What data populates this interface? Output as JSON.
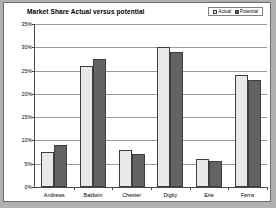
{
  "chart_data": {
    "type": "bar",
    "title": "Market Share Actual versus potential",
    "xlabel": "",
    "ylabel": "",
    "categories": [
      "Andrews",
      "Baldwin",
      "Chester",
      "Digby",
      "Erie",
      "Ferris"
    ],
    "series": [
      {
        "name": "Actual",
        "values": [
          7.5,
          26.0,
          8.0,
          30.0,
          6.0,
          24.0
        ],
        "color": "#e8e8e8"
      },
      {
        "name": "Potential",
        "values": [
          9.0,
          27.5,
          7.0,
          29.0,
          5.5,
          23.0
        ],
        "color": "#636363"
      }
    ],
    "ylim": [
      0,
      35
    ],
    "ytick_values": [
      0,
      5,
      10,
      15,
      20,
      25,
      30,
      35
    ],
    "ytick_labels": [
      "0%",
      "5%",
      "10%",
      "15%",
      "20%",
      "25%",
      "30%",
      "35%"
    ],
    "grid": true,
    "legend_position": "top-right"
  },
  "legend": {
    "entries": [
      {
        "label": "Actual"
      },
      {
        "label": "Potential"
      }
    ]
  },
  "colors": {
    "actual": "#e8e8e8",
    "potential": "#636363",
    "plot_background": "#ffffff",
    "page_background": "#b0b0b0",
    "gridline": "#9a9a9a",
    "axis": "#4a4a4a"
  }
}
